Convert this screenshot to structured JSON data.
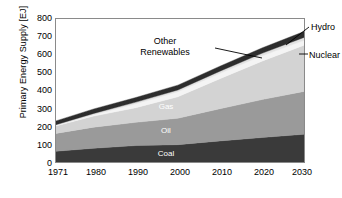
{
  "chart_data": {
    "type": "area",
    "title": "",
    "subtitle": "",
    "xlabel": "",
    "ylabel": "Primary Energy Supply [EJ]",
    "xlim": [
      1971,
      2030
    ],
    "ylim": [
      0,
      800
    ],
    "grid": false,
    "legend_position": "in-plot and callout labels",
    "stacked": true,
    "x": [
      1971,
      1980,
      1990,
      2000,
      2010,
      2020,
      2030
    ],
    "xtick_labels": [
      "1971",
      "1980",
      "1990",
      "2000",
      "2010",
      "2020",
      "2030"
    ],
    "ytick_labels": [
      "0",
      "100",
      "200",
      "300",
      "400",
      "500",
      "600",
      "700",
      "800"
    ],
    "ytick_values": [
      0,
      100,
      200,
      300,
      400,
      500,
      600,
      700,
      800
    ],
    "series": [
      {
        "name": "Coal",
        "values": [
          60,
          77,
          92,
          97,
          118,
          137,
          155
        ],
        "color": "#3a3a3a"
      },
      {
        "name": "Oil",
        "values": [
          100,
          118,
          130,
          148,
          180,
          212,
          240
        ],
        "color": "#9a9a9a"
      },
      {
        "name": "Gas",
        "values": [
          42,
          62,
          82,
          120,
          168,
          215,
          258
        ],
        "color": "#d3d3d3"
      },
      {
        "name": "Nuclear",
        "values": [
          2,
          8,
          22,
          28,
          30,
          30,
          28
        ],
        "color": "#f4f4f4"
      },
      {
        "name": "Hydro",
        "values": [
          5,
          7,
          9,
          10,
          12,
          14,
          16
        ],
        "color": "#e2e2e2"
      },
      {
        "name": "Other Renewables",
        "values": [
          21,
          25,
          26,
          27,
          28,
          30,
          33
        ],
        "color": "#2d2d2d"
      }
    ],
    "totals": [
      230,
      297,
      361,
      430,
      536,
      638,
      690
    ],
    "annotations": [
      {
        "label": "Other Renewables",
        "kind": "callout-left"
      },
      {
        "label": "Hydro",
        "kind": "callout-right"
      },
      {
        "label": "Nuclear",
        "kind": "callout-right"
      },
      {
        "label": "Gas",
        "kind": "inline"
      },
      {
        "label": "Oil",
        "kind": "inline"
      },
      {
        "label": "Coal",
        "kind": "inline"
      }
    ]
  },
  "axis": {
    "y_title": "Primary Energy Supply [EJ]",
    "y_ticks": [
      "800",
      "700",
      "600",
      "500",
      "400",
      "300",
      "200",
      "100",
      "0"
    ],
    "x_ticks": [
      "1971",
      "1980",
      "1990",
      "2000",
      "2010",
      "2020",
      "2030"
    ]
  },
  "labels": {
    "coal": "Coal",
    "oil": "Oil",
    "gas": "Gas",
    "nuclear": "Nuclear",
    "hydro": "Hydro",
    "other_renewables_line1": "Other",
    "other_renewables_line2": "Renewables"
  },
  "colors": {
    "coal": "#3a3a3a",
    "oil": "#9a9a9a",
    "gas": "#d3d3d3",
    "nuclear": "#f4f4f4",
    "hydro": "#e2e2e2",
    "other_renewables": "#2d2d2d",
    "frame": "#8a8a8a",
    "background": "#ffffff",
    "text": "#000000"
  }
}
